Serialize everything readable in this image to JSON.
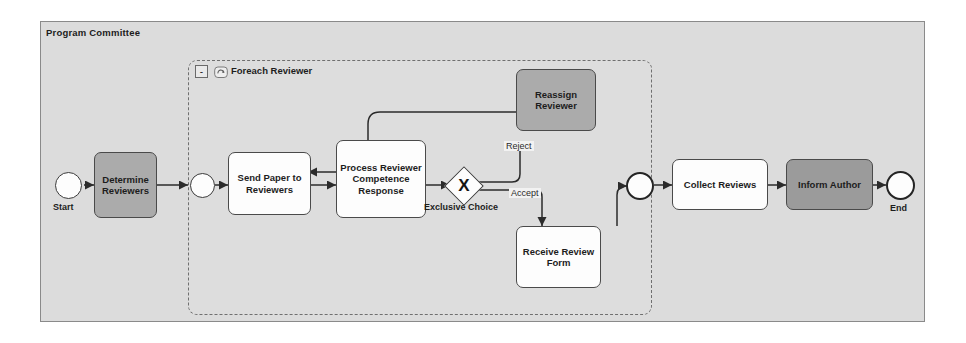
{
  "diagram": {
    "type": "bpmn-process-diagram",
    "pool": {
      "title": "Program Committee"
    },
    "subprocess": {
      "label": "Foreach Reviewer",
      "collapse_label": "-",
      "loop_icon": "loop-marker-icon"
    },
    "events": [
      {
        "id": "start",
        "label": "Start",
        "kind": "start-event"
      },
      {
        "id": "sp-entry",
        "label": "",
        "kind": "intermediate-event"
      },
      {
        "id": "sp-exit",
        "label": "",
        "kind": "intermediate-event-thick"
      },
      {
        "id": "end",
        "label": "End",
        "kind": "end-event"
      }
    ],
    "tasks": [
      {
        "id": "determine-reviewers",
        "label": "Determine Reviewers",
        "fill": "#ababab"
      },
      {
        "id": "send-paper",
        "label": "Send Paper to Reviewers",
        "fill": "#fdfdfd"
      },
      {
        "id": "process-response",
        "label": "Process Reviewer Competence Response",
        "fill": "#fdfdfd"
      },
      {
        "id": "reassign-reviewer",
        "label": "Reassign Reviewer",
        "fill": "#ababab"
      },
      {
        "id": "receive-review-form",
        "label": "Receive Review Form",
        "fill": "#fdfdfd"
      },
      {
        "id": "collect-reviews",
        "label": "Collect Reviews",
        "fill": "#fdfdfd"
      },
      {
        "id": "inform-author",
        "label": "Inform Author",
        "fill": "#9b9b9b"
      }
    ],
    "gateway": {
      "id": "exclusive-choice",
      "label": "Exclusive Choice",
      "marker": "X"
    },
    "flow_labels": [
      {
        "id": "reject",
        "label": "Reject"
      },
      {
        "id": "accept",
        "label": "Accept"
      }
    ],
    "colors": {
      "pool_fill": "#dcdcdc",
      "pool_border": "#8a8a8a",
      "task_border": "#4a4a4a",
      "edge": "#2b2b2b"
    }
  }
}
